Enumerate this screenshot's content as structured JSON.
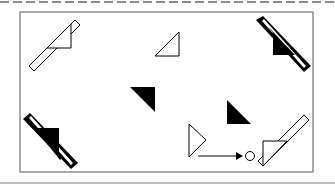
{
  "figure": {
    "colors": {
      "stroke": "#000000",
      "fill_dark": "#000000",
      "fill_light": "#ffffff",
      "frame": "#555555",
      "dash": "#666666",
      "bottom_rule": "#aaaaaa"
    },
    "frame": {
      "x": 20,
      "y": 12,
      "w": 293,
      "h": 160
    },
    "shapes": [
      {
        "id": "top-left-bar-triangle",
        "type": "bar-with-triangle",
        "fill": "white"
      },
      {
        "id": "top-center-triangle",
        "type": "triangle",
        "fill": "white"
      },
      {
        "id": "top-right-bar-triangle",
        "type": "bar-with-triangle",
        "fill": "black"
      },
      {
        "id": "center-left-triangle",
        "type": "triangle",
        "fill": "black"
      },
      {
        "id": "center-right-triangle",
        "type": "triangle",
        "fill": "black"
      },
      {
        "id": "bottom-left-bar-triangle",
        "type": "bar-with-triangle",
        "fill": "black"
      },
      {
        "id": "bottom-center-triangle-arrow",
        "type": "triangle-arrow-circle",
        "fill": "white"
      },
      {
        "id": "bottom-right-bar-triangle",
        "type": "bar-with-triangle",
        "fill": "white"
      }
    ]
  }
}
